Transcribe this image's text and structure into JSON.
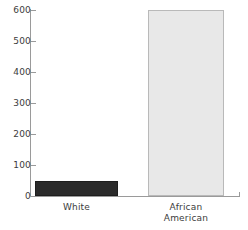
{
  "chart_data": {
    "type": "bar",
    "title": "",
    "subtitle": "",
    "xlabel": "",
    "ylabel": "",
    "categories": [
      "White",
      "African American"
    ],
    "category_lines": [
      [
        "White"
      ],
      [
        "African",
        "American"
      ]
    ],
    "values": [
      48,
      600
    ],
    "ylim": [
      0,
      600
    ],
    "yticks": [
      0,
      100,
      200,
      300,
      400,
      500,
      600
    ],
    "ytick_labels": [
      "0",
      "100",
      "200",
      "300",
      "400",
      "500",
      "600"
    ],
    "grid": false,
    "legend": false,
    "legend_position": "none",
    "bar_colors": [
      "#2b2b2b",
      "#e8e8e8"
    ],
    "bar_edge_colors": [
      "#1e1e1e",
      "#b9b9b9"
    ],
    "axis_color": "#9a9a9a",
    "background_color": "#ffffff",
    "text_color": "#3c3c3c",
    "annotations": []
  }
}
